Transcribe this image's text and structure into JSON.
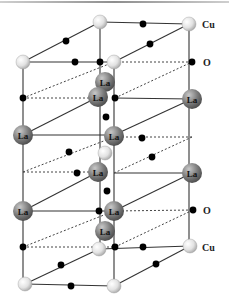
{
  "figure": {
    "title": "",
    "labels": {
      "cu_top": "Cu",
      "o_top": "O",
      "o_bottom": "O",
      "cu_bottom": "Cu"
    },
    "la_label": "La",
    "legend_atoms": [
      {
        "name": "Cu",
        "style": "light gray sphere"
      },
      {
        "name": "O",
        "style": "small black dot"
      },
      {
        "name": "La",
        "style": "large dark gray sphere"
      }
    ],
    "colors": {
      "cu": "#e4e4e4",
      "o": "#000000",
      "la": "#7a7a7a",
      "bond": "#333333",
      "dashed": "#444444",
      "top_border": "#9a9a9a"
    }
  }
}
